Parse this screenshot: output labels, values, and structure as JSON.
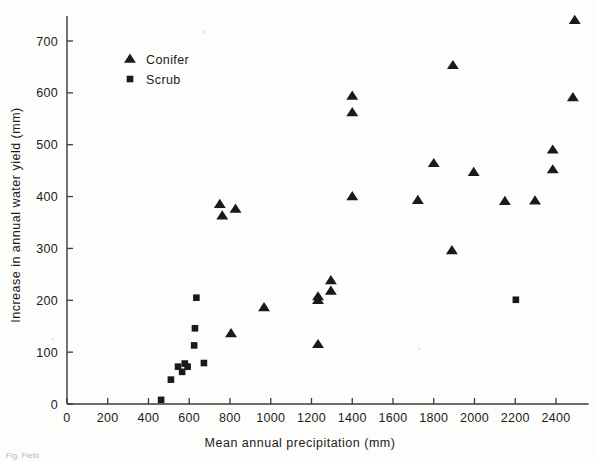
{
  "chart_data": {
    "type": "scatter",
    "title": "",
    "xlabel": "Mean annual precipitation (mm)",
    "ylabel": "Increase in annual water yield (mm)",
    "xlim": [
      0,
      2560
    ],
    "ylim": [
      0,
      760
    ],
    "xticks": [
      0,
      200,
      400,
      600,
      800,
      1000,
      1200,
      1400,
      1600,
      1800,
      2000,
      2200,
      2400
    ],
    "yticks": [
      0,
      100,
      200,
      300,
      400,
      500,
      600,
      700
    ],
    "grid": false,
    "legend_position": "top-left-inside",
    "series": [
      {
        "name": "Conifer",
        "marker": "triangle",
        "color": "#1a1a1a",
        "points": [
          [
            750,
            385
          ],
          [
            762,
            363
          ],
          [
            827,
            376
          ],
          [
            805,
            136
          ],
          [
            967,
            186
          ],
          [
            1232,
            207
          ],
          [
            1232,
            200
          ],
          [
            1232,
            115
          ],
          [
            1295,
            238
          ],
          [
            1295,
            218
          ],
          [
            1400,
            594
          ],
          [
            1400,
            562
          ],
          [
            1400,
            400
          ],
          [
            1722,
            393
          ],
          [
            1800,
            464
          ],
          [
            1889,
            296
          ],
          [
            1894,
            653
          ],
          [
            1996,
            447
          ],
          [
            2149,
            391
          ],
          [
            2297,
            392
          ],
          [
            2384,
            490
          ],
          [
            2384,
            452
          ],
          [
            2483,
            591
          ],
          [
            2492,
            740
          ]
        ]
      },
      {
        "name": "Scrub",
        "marker": "square",
        "color": "#1a1a1a",
        "points": [
          [
            462,
            8
          ],
          [
            510,
            47
          ],
          [
            545,
            72
          ],
          [
            565,
            62
          ],
          [
            578,
            78
          ],
          [
            592,
            72
          ],
          [
            624,
            113
          ],
          [
            628,
            146
          ],
          [
            635,
            205
          ],
          [
            672,
            79
          ],
          [
            2203,
            201
          ]
        ]
      }
    ]
  },
  "legend": {
    "entries": [
      {
        "label": "Conifer",
        "marker": "triangle"
      },
      {
        "label": "Scrub",
        "marker": "square"
      }
    ]
  },
  "axes": {
    "x_title": "Mean annual precipitation (mm)",
    "y_title": "Increase in annual water yield (mm)",
    "x_tick_labels": [
      "0",
      "200",
      "400",
      "600",
      "800",
      "1000",
      "1200",
      "1400",
      "1600",
      "1800",
      "2000",
      "2200",
      "2400"
    ],
    "y_tick_labels": [
      "0",
      "100",
      "200",
      "300",
      "400",
      "500",
      "600",
      "700"
    ]
  },
  "colors": {
    "marker": "#1a1a1a",
    "axis": "#3a3a38",
    "background": "#fdfdfb",
    "text": "#1b1b1b"
  },
  "caption": "Fig. Field"
}
